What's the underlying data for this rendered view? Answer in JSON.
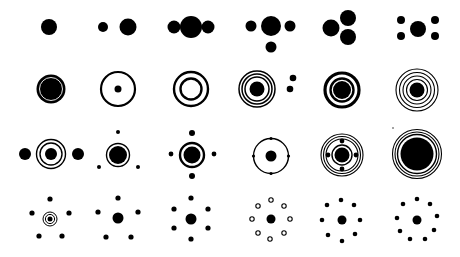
{
  "title": "Circle and dot symbol set",
  "colors": {
    "ink": "#000000",
    "background": "#ffffff"
  },
  "grid": {
    "rows": 4,
    "columns": 6
  },
  "icons": [
    {
      "row": 0,
      "col": 0,
      "name": "single-dot-icon",
      "shapes": [
        {
          "t": "d",
          "x": 49,
          "y": 27,
          "r": 8
        }
      ]
    },
    {
      "row": 0,
      "col": 1,
      "name": "two-dots-icon",
      "shapes": [
        {
          "t": "d",
          "x": 103,
          "y": 27,
          "r": 5
        },
        {
          "t": "d",
          "x": 128,
          "y": 27,
          "r": 8.5
        }
      ]
    },
    {
      "row": 0,
      "col": 2,
      "name": "three-dots-row-icon",
      "shapes": [
        {
          "t": "d",
          "x": 174,
          "y": 27,
          "r": 6.5
        },
        {
          "t": "d",
          "x": 191,
          "y": 27,
          "r": 11
        },
        {
          "t": "d",
          "x": 208,
          "y": 27,
          "r": 6.5
        }
      ]
    },
    {
      "row": 0,
      "col": 3,
      "name": "four-dots-t-icon",
      "shapes": [
        {
          "t": "d",
          "x": 251,
          "y": 26,
          "r": 5.5
        },
        {
          "t": "d",
          "x": 271,
          "y": 26,
          "r": 10
        },
        {
          "t": "d",
          "x": 290,
          "y": 26,
          "r": 5.5
        },
        {
          "t": "d",
          "x": 271,
          "y": 47,
          "r": 5.5
        }
      ]
    },
    {
      "row": 0,
      "col": 4,
      "name": "three-dots-cluster-icon",
      "shapes": [
        {
          "t": "d",
          "x": 331,
          "y": 28,
          "r": 8.5
        },
        {
          "t": "d",
          "x": 348,
          "y": 18,
          "r": 8
        },
        {
          "t": "d",
          "x": 348,
          "y": 37,
          "r": 8
        }
      ]
    },
    {
      "row": 0,
      "col": 5,
      "name": "dot-with-four-corners-icon",
      "shapes": [
        {
          "t": "d",
          "x": 418,
          "y": 29,
          "r": 8
        },
        {
          "t": "d",
          "x": 401,
          "y": 20,
          "r": 4
        },
        {
          "t": "d",
          "x": 435,
          "y": 20,
          "r": 4
        },
        {
          "t": "d",
          "x": 401,
          "y": 36,
          "r": 4
        },
        {
          "t": "d",
          "x": 435,
          "y": 36,
          "r": 4
        }
      ]
    },
    {
      "row": 1,
      "col": 0,
      "name": "filled-disc-ring-icon",
      "shapes": [
        {
          "t": "d",
          "x": 51,
          "y": 89,
          "r": 14.5
        },
        {
          "t": "r",
          "x": 51,
          "y": 89,
          "r": 11.5,
          "w": 0.9,
          "c": "#ffffff"
        }
      ]
    },
    {
      "row": 1,
      "col": 1,
      "name": "circle-with-dot-icon",
      "shapes": [
        {
          "t": "r",
          "x": 118,
          "y": 89,
          "r": 17,
          "w": 2.2
        },
        {
          "t": "d",
          "x": 118,
          "y": 89,
          "r": 3.5
        }
      ]
    },
    {
      "row": 1,
      "col": 2,
      "name": "double-ring-icon",
      "shapes": [
        {
          "t": "r",
          "x": 191,
          "y": 89,
          "r": 17,
          "w": 2.4
        },
        {
          "t": "r",
          "x": 191,
          "y": 89,
          "r": 10.5,
          "w": 2.4
        }
      ]
    },
    {
      "row": 1,
      "col": 3,
      "name": "target-with-satellites-icon",
      "shapes": [
        {
          "t": "r",
          "x": 257,
          "y": 89,
          "r": 18,
          "w": 1.5
        },
        {
          "t": "r",
          "x": 257,
          "y": 89,
          "r": 15,
          "w": 1.5
        },
        {
          "t": "r",
          "x": 257,
          "y": 89,
          "r": 12,
          "w": 1.5
        },
        {
          "t": "d",
          "x": 257,
          "y": 89,
          "r": 7.5
        },
        {
          "t": "d",
          "x": 293,
          "y": 78,
          "r": 3.3
        },
        {
          "t": "d",
          "x": 290,
          "y": 89,
          "r": 3.3
        }
      ]
    },
    {
      "row": 1,
      "col": 4,
      "name": "bold-target-icon",
      "shapes": [
        {
          "t": "r",
          "x": 342,
          "y": 90,
          "r": 17,
          "w": 3.2
        },
        {
          "t": "r",
          "x": 342,
          "y": 90,
          "r": 11.5,
          "w": 2.4
        },
        {
          "t": "d",
          "x": 342,
          "y": 90,
          "r": 9
        }
      ]
    },
    {
      "row": 1,
      "col": 5,
      "name": "multi-ring-target-icon",
      "shapes": [
        {
          "t": "r",
          "x": 417,
          "y": 90,
          "r": 21,
          "w": 1.1
        },
        {
          "t": "r",
          "x": 417,
          "y": 90,
          "r": 17.5,
          "w": 1.1
        },
        {
          "t": "r",
          "x": 417,
          "y": 90,
          "r": 14,
          "w": 1.1
        },
        {
          "t": "r",
          "x": 417,
          "y": 90,
          "r": 10.5,
          "w": 1.1
        },
        {
          "t": "d",
          "x": 417,
          "y": 90,
          "r": 7.5
        }
      ]
    },
    {
      "row": 2,
      "col": 0,
      "name": "ringed-dot-between-dots-icon",
      "shapes": [
        {
          "t": "d",
          "x": 25,
          "y": 154,
          "r": 6
        },
        {
          "t": "r",
          "x": 51,
          "y": 154,
          "r": 14.5,
          "w": 1.4
        },
        {
          "t": "r",
          "x": 51,
          "y": 154,
          "r": 11,
          "w": 1.4
        },
        {
          "t": "d",
          "x": 51,
          "y": 154,
          "r": 6
        },
        {
          "t": "d",
          "x": 78,
          "y": 154,
          "r": 6
        }
      ]
    },
    {
      "row": 2,
      "col": 1,
      "name": "ringed-dot-three-satellites-icon",
      "shapes": [
        {
          "t": "d",
          "x": 118,
          "y": 132,
          "r": 2
        },
        {
          "t": "r",
          "x": 118,
          "y": 155,
          "r": 11.5,
          "w": 1.4
        },
        {
          "t": "d",
          "x": 118,
          "y": 155,
          "r": 9
        },
        {
          "t": "d",
          "x": 99,
          "y": 167,
          "r": 2
        },
        {
          "t": "d",
          "x": 138,
          "y": 167,
          "r": 2
        }
      ]
    },
    {
      "row": 2,
      "col": 2,
      "name": "ringed-dot-four-satellites-icon",
      "shapes": [
        {
          "t": "d",
          "x": 192,
          "y": 133,
          "r": 3
        },
        {
          "t": "r",
          "x": 192,
          "y": 155,
          "r": 12,
          "w": 2.4
        },
        {
          "t": "d",
          "x": 192,
          "y": 155,
          "r": 8.5
        },
        {
          "t": "d",
          "x": 171,
          "y": 154,
          "r": 2.4
        },
        {
          "t": "d",
          "x": 214,
          "y": 154,
          "r": 2.4
        },
        {
          "t": "d",
          "x": 192,
          "y": 176,
          "r": 3
        }
      ]
    },
    {
      "row": 2,
      "col": 3,
      "name": "orbit-with-nodes-icon",
      "shapes": [
        {
          "t": "r",
          "x": 271,
          "y": 156,
          "r": 17.5,
          "w": 1.4
        },
        {
          "t": "d",
          "x": 271,
          "y": 156,
          "r": 5.5
        },
        {
          "t": "d",
          "x": 271,
          "y": 138.5,
          "r": 1.6
        },
        {
          "t": "d",
          "x": 288.5,
          "y": 156,
          "r": 1.6
        },
        {
          "t": "d",
          "x": 271,
          "y": 173.5,
          "r": 1.6
        },
        {
          "t": "d",
          "x": 253.5,
          "y": 156,
          "r": 1.6
        }
      ]
    },
    {
      "row": 2,
      "col": 4,
      "name": "atom-orbits-icon",
      "shapes": [
        {
          "t": "r",
          "x": 342,
          "y": 155,
          "r": 21,
          "w": 1.1
        },
        {
          "t": "r",
          "x": 342,
          "y": 155,
          "r": 18.5,
          "w": 1.1
        },
        {
          "t": "r",
          "x": 342,
          "y": 155,
          "r": 16,
          "w": 1.1
        },
        {
          "t": "r",
          "x": 342,
          "y": 155,
          "r": 10,
          "w": 1.4
        },
        {
          "t": "d",
          "x": 342,
          "y": 155,
          "r": 7.5
        },
        {
          "t": "d",
          "x": 342,
          "y": 141,
          "r": 2.4
        },
        {
          "t": "d",
          "x": 356,
          "y": 155,
          "r": 2.4
        },
        {
          "t": "d",
          "x": 342,
          "y": 169,
          "r": 2.4
        },
        {
          "t": "d",
          "x": 328,
          "y": 155,
          "r": 2.4
        }
      ]
    },
    {
      "row": 2,
      "col": 5,
      "name": "large-disc-rings-icon",
      "shapes": [
        {
          "t": "r",
          "x": 417,
          "y": 154,
          "r": 24.5,
          "w": 1.1
        },
        {
          "t": "r",
          "x": 417,
          "y": 154,
          "r": 22,
          "w": 1.1
        },
        {
          "t": "r",
          "x": 417,
          "y": 154,
          "r": 19.5,
          "w": 1.4
        },
        {
          "t": "d",
          "x": 417,
          "y": 154,
          "r": 16.5
        },
        {
          "t": "d",
          "x": 393,
          "y": 128,
          "r": 0.7
        }
      ]
    },
    {
      "row": 3,
      "col": 0,
      "name": "bullseye-five-dots-icon",
      "shapes": [
        {
          "t": "d",
          "x": 50,
          "y": 199,
          "r": 2.6
        },
        {
          "t": "d",
          "x": 32,
          "y": 213,
          "r": 2.6
        },
        {
          "t": "d",
          "x": 69,
          "y": 213,
          "r": 2.6
        },
        {
          "t": "r",
          "x": 50,
          "y": 219,
          "r": 7,
          "w": 1
        },
        {
          "t": "r",
          "x": 50,
          "y": 219,
          "r": 4.6,
          "w": 1
        },
        {
          "t": "d",
          "x": 50,
          "y": 219,
          "r": 2.5
        },
        {
          "t": "d",
          "x": 39,
          "y": 236,
          "r": 2.6
        },
        {
          "t": "d",
          "x": 62,
          "y": 236,
          "r": 2.6
        }
      ]
    },
    {
      "row": 3,
      "col": 1,
      "name": "dot-five-satellites-icon",
      "shapes": [
        {
          "t": "d",
          "x": 118,
          "y": 198,
          "r": 2.6
        },
        {
          "t": "d",
          "x": 98,
          "y": 212,
          "r": 2.6
        },
        {
          "t": "d",
          "x": 138,
          "y": 212,
          "r": 2.6
        },
        {
          "t": "d",
          "x": 118,
          "y": 218,
          "r": 5.5
        },
        {
          "t": "d",
          "x": 106,
          "y": 237,
          "r": 2.6
        },
        {
          "t": "d",
          "x": 131,
          "y": 237,
          "r": 2.6
        }
      ]
    },
    {
      "row": 3,
      "col": 2,
      "name": "dot-six-satellites-icon",
      "shapes": [
        {
          "t": "d",
          "x": 191,
          "y": 198,
          "r": 2.6
        },
        {
          "t": "d",
          "x": 174,
          "y": 209,
          "r": 2.6
        },
        {
          "t": "d",
          "x": 208,
          "y": 209,
          "r": 2.6
        },
        {
          "t": "d",
          "x": 191,
          "y": 219,
          "r": 5.5
        },
        {
          "t": "d",
          "x": 174,
          "y": 228,
          "r": 2.6
        },
        {
          "t": "d",
          "x": 208,
          "y": 228,
          "r": 2.6
        },
        {
          "t": "d",
          "x": 191,
          "y": 239,
          "r": 2.6
        }
      ]
    },
    {
      "row": 3,
      "col": 3,
      "name": "dot-eight-hollow-satellites-icon",
      "shapes": [
        {
          "t": "d",
          "x": 271,
          "y": 219,
          "r": 4.5
        },
        {
          "t": "o",
          "x": 271,
          "y": 200,
          "r": 2.2
        },
        {
          "t": "o",
          "x": 284,
          "y": 206,
          "r": 2.2
        },
        {
          "t": "o",
          "x": 290,
          "y": 219,
          "r": 2.2
        },
        {
          "t": "o",
          "x": 284,
          "y": 233,
          "r": 2.2
        },
        {
          "t": "o",
          "x": 270,
          "y": 239,
          "r": 2.2
        },
        {
          "t": "o",
          "x": 258,
          "y": 233,
          "r": 2.2
        },
        {
          "t": "o",
          "x": 252,
          "y": 219,
          "r": 2.2
        },
        {
          "t": "o",
          "x": 258,
          "y": 206,
          "r": 2.2
        }
      ]
    },
    {
      "row": 3,
      "col": 4,
      "name": "dot-eight-satellites-icon",
      "shapes": [
        {
          "t": "d",
          "x": 342,
          "y": 220,
          "r": 4.5
        },
        {
          "t": "d",
          "x": 341,
          "y": 200,
          "r": 2.3
        },
        {
          "t": "d",
          "x": 354,
          "y": 205,
          "r": 2.3
        },
        {
          "t": "d",
          "x": 360,
          "y": 220,
          "r": 2.3
        },
        {
          "t": "d",
          "x": 355,
          "y": 234,
          "r": 2.3
        },
        {
          "t": "d",
          "x": 342,
          "y": 241,
          "r": 2.3
        },
        {
          "t": "d",
          "x": 328,
          "y": 235,
          "r": 2.3
        },
        {
          "t": "d",
          "x": 322,
          "y": 220,
          "r": 2.3
        },
        {
          "t": "d",
          "x": 327,
          "y": 205,
          "r": 2.3
        }
      ]
    },
    {
      "row": 3,
      "col": 5,
      "name": "dot-nine-satellites-icon",
      "shapes": [
        {
          "t": "d",
          "x": 417,
          "y": 220,
          "r": 4.5
        },
        {
          "t": "d",
          "x": 417,
          "y": 199,
          "r": 2.3
        },
        {
          "t": "d",
          "x": 430,
          "y": 204,
          "r": 2.3
        },
        {
          "t": "d",
          "x": 437,
          "y": 216,
          "r": 2.3
        },
        {
          "t": "d",
          "x": 434,
          "y": 230,
          "r": 2.3
        },
        {
          "t": "d",
          "x": 425,
          "y": 239,
          "r": 2.3
        },
        {
          "t": "d",
          "x": 410,
          "y": 239,
          "r": 2.3
        },
        {
          "t": "d",
          "x": 400,
          "y": 231,
          "r": 2.3
        },
        {
          "t": "d",
          "x": 397,
          "y": 218,
          "r": 2.3
        },
        {
          "t": "d",
          "x": 403,
          "y": 204,
          "r": 2.3
        }
      ]
    }
  ]
}
